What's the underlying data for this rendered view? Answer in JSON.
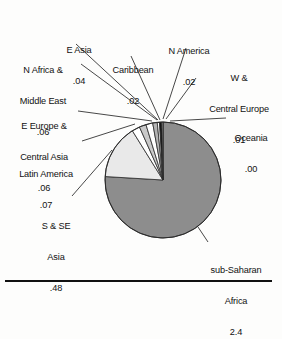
{
  "figure": {
    "title": "",
    "bottom_rule": true
  },
  "chart_data": {
    "type": "pie",
    "title": "",
    "xlabel": "",
    "ylabel": "",
    "legend_position": "callout-labels",
    "grid": false,
    "units": "millions",
    "total": 3.26,
    "categories": [
      "sub-Saharan Africa",
      "S & SE Asia",
      "Latin America",
      "E Europe & Central Asia",
      "N Africa & Middle East",
      "E Asia",
      "Caribbean",
      "N America",
      "W & Central Europe",
      "Oceania"
    ],
    "values": [
      2.4,
      0.48,
      0.07,
      0.06,
      0.06,
      0.04,
      0.02,
      0.02,
      0.01,
      0.0
    ],
    "value_labels": [
      ".4",
      ".48",
      ".07",
      ".06",
      ".06",
      ".04",
      ".02",
      ".02",
      ".01",
      ".00"
    ],
    "colors": [
      "#8d8d8d",
      "#e9e9e9",
      "#ffffff",
      "#c9c9c9",
      "#ffffff",
      "#b4b4b4",
      "#ffffff",
      "#121212",
      "#ffffff",
      "#ffffff"
    ],
    "slices": [
      {
        "name": "sub-Saharan Africa",
        "value": 2.4,
        "label": "sub-Saharan\nAfrica",
        "value_label": "2.4",
        "color": "#8d8d8d"
      },
      {
        "name": "S & SE Asia",
        "value": 0.48,
        "label": "S & SE\nAsia",
        "value_label": ".48",
        "color": "#e9e9e9"
      },
      {
        "name": "Latin America",
        "value": 0.07,
        "label": "Latin America",
        "value_label": ".07",
        "color": "#ffffff"
      },
      {
        "name": "E Europe & Central Asia",
        "value": 0.06,
        "label": "E Europe &\nCentral Asia",
        "value_label": ".06",
        "color": "#c9c9c9"
      },
      {
        "name": "N Africa & Middle East",
        "value": 0.06,
        "label": "N Africa &\nMiddle East",
        "value_label": ".06",
        "color": "#ffffff"
      },
      {
        "name": "E Asia",
        "value": 0.04,
        "label": "E Asia",
        "value_label": ".04",
        "color": "#b4b4b4"
      },
      {
        "name": "Caribbean",
        "value": 0.02,
        "label": "Caribbean",
        "value_label": ".02",
        "color": "#ffffff"
      },
      {
        "name": "N America",
        "value": 0.02,
        "label": "N America",
        "value_label": ".02",
        "color": "#121212"
      },
      {
        "name": "W & Central Europe",
        "value": 0.01,
        "label": "W &\nCentral Europe",
        "value_label": ".01",
        "color": "#ffffff"
      },
      {
        "name": "Oceania",
        "value": 0.0,
        "label": "Oceania",
        "value_label": ".00",
        "color": "#ffffff"
      }
    ]
  },
  "labels": {
    "e_asia_name": "E Asia",
    "e_asia_value": ".04",
    "n_africa_name_1": "N Africa &",
    "n_africa_name_2": "Middle East",
    "n_africa_value": ".06",
    "e_europe_name_1": "E Europe &",
    "e_europe_name_2": "Central Asia",
    "e_europe_value": ".06",
    "latin_america_name": "Latin America",
    "latin_america_value": ".07",
    "s_se_asia_name_1": "S & SE",
    "s_se_asia_name_2": "Asia",
    "s_se_asia_value": ".48",
    "caribbean_name": "Caribbean",
    "caribbean_value": ".02",
    "n_america_name": "N America",
    "n_america_value": ".02",
    "w_europe_name_1": "W &",
    "w_europe_name_2": "Central Europe",
    "w_europe_value": ".01",
    "oceania_name": "Oceania",
    "oceania_value": ".00",
    "subsaharan_name_1": "sub-Saharan",
    "subsaharan_name_2": "Africa",
    "subsaharan_value": "2.4"
  }
}
